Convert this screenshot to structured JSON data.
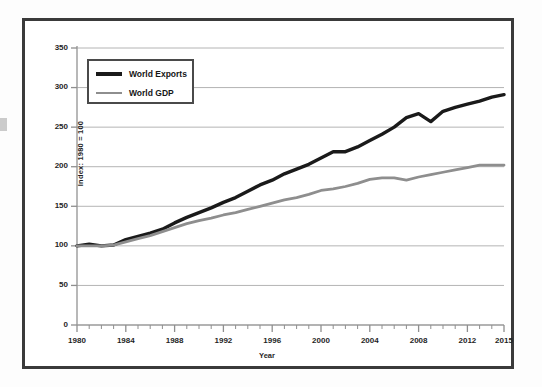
{
  "chart_data": {
    "type": "line",
    "title": "",
    "xlabel": "Year",
    "ylabel": "Index: 1980 = 100",
    "xlim": [
      1980,
      2015
    ],
    "ylim": [
      0,
      350
    ],
    "ytick_interval": 50,
    "xtick_interval": 4,
    "grid": true,
    "grid_axis": "y",
    "minor_xticks_every": 1,
    "legend_position": "upper left",
    "yticks": [
      0,
      50,
      100,
      150,
      200,
      250,
      300,
      350
    ],
    "xticks": [
      1980,
      1984,
      1988,
      1992,
      1996,
      2000,
      2004,
      2008,
      2012,
      2015
    ],
    "x": [
      1980,
      1981,
      1982,
      1983,
      1984,
      1985,
      1986,
      1987,
      1988,
      1989,
      1990,
      1991,
      1992,
      1993,
      1994,
      1995,
      1996,
      1997,
      1998,
      1999,
      2000,
      2001,
      2002,
      2003,
      2004,
      2005,
      2006,
      2007,
      2008,
      2009,
      2010,
      2011,
      2012,
      2013,
      2014,
      2015
    ],
    "series": [
      {
        "name": "World Exports",
        "color": "#1a1a1a",
        "width": 3.4,
        "values": [
          100,
          102,
          100,
          101,
          108,
          112,
          116,
          121,
          129,
          136,
          142,
          148,
          155,
          161,
          169,
          177,
          183,
          191,
          197,
          203,
          211,
          219,
          219,
          225,
          233,
          241,
          250,
          262,
          267,
          257,
          270,
          275,
          279,
          283,
          288,
          291
        ]
      },
      {
        "name": "World GDP",
        "color": "#8e8e8e",
        "width": 2.8,
        "values": [
          100,
          100,
          100,
          101,
          105,
          109,
          113,
          118,
          123,
          128,
          132,
          135,
          139,
          142,
          146,
          150,
          154,
          158,
          161,
          165,
          170,
          172,
          175,
          179,
          184,
          186,
          186,
          183,
          187,
          190,
          193,
          196,
          199,
          202,
          202,
          202
        ]
      }
    ]
  },
  "legend": {
    "items": [
      {
        "label": "World Exports"
      },
      {
        "label": "World GDP"
      }
    ]
  },
  "axes": {
    "y_title": "Index: 1980 = 100",
    "x_title": "Year"
  }
}
